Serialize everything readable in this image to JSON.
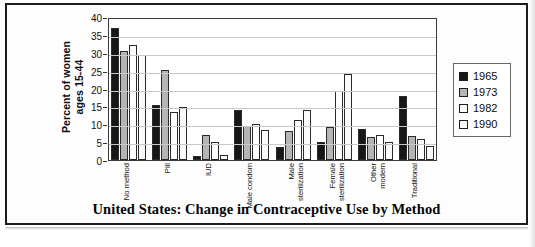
{
  "chart_data": {
    "type": "bar",
    "title": "United States: Change in Contraceptive Use by Method",
    "xlabel": "",
    "ylabel": "Percent of women\nages 15-44",
    "ylim": [
      0,
      40
    ],
    "ytick_step": 5,
    "yticks": [
      "0",
      "5",
      "10",
      "15",
      "20",
      "25",
      "30",
      "35",
      "40"
    ],
    "grid": true,
    "legend_position": "right",
    "categories": [
      "No method",
      "Pill",
      "IUD",
      "Male condom",
      "Male\nsterilization",
      "Female\nsterilization",
      "Other\nmodern",
      "Traditional"
    ],
    "series": [
      {
        "name": "1965",
        "color": "#1a1614",
        "values": [
          36.8,
          15.3,
          1.0,
          14.1,
          3.6,
          5.0,
          8.7,
          17.9
        ]
      },
      {
        "name": "1973",
        "color": "#b5b5b5",
        "values": [
          30.5,
          25.1,
          6.9,
          9.5,
          8.0,
          9.2,
          6.4,
          6.8
        ]
      },
      {
        "name": "1982",
        "color": "#ffffff",
        "values": [
          32.1,
          13.5,
          5.0,
          10.0,
          11.1,
          19.2,
          6.9,
          5.9
        ]
      },
      {
        "name": "1990",
        "color": "#fbfbfb",
        "values": [
          29.4,
          14.7,
          1.3,
          8.3,
          14.1,
          24.2,
          5.1,
          3.9
        ]
      }
    ]
  },
  "legend": {
    "items": [
      {
        "label": "1965"
      },
      {
        "label": "1973"
      },
      {
        "label": "1982"
      },
      {
        "label": "1990"
      }
    ]
  }
}
